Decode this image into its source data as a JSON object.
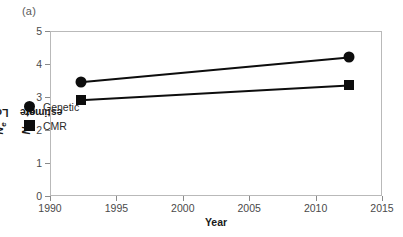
{
  "panel_label": "(a)",
  "chart_data": {
    "type": "line",
    "title": "",
    "subtitle": "",
    "xlabel": "Year",
    "ylabel": "Log Ne or Nb estimate",
    "ylabel_parts": {
      "prefix": "Log ",
      "sym1": "N",
      "sub1": "e",
      "middle": " or ",
      "sym2": "N",
      "sub2": "b",
      "suffix": " estimate"
    },
    "xlim": [
      1990,
      2015
    ],
    "ylim": [
      0,
      5
    ],
    "xticks": [
      1990,
      1995,
      2000,
      2005,
      2010,
      2015
    ],
    "xtick_labels": [
      "1990",
      "1995",
      "2000",
      "2005",
      "2010",
      "2015"
    ],
    "yticks": [
      0,
      1,
      2,
      3,
      4,
      5
    ],
    "ytick_labels": [
      "0",
      "1",
      "2",
      "3",
      "4",
      "5"
    ],
    "grid": false,
    "legend_position": "inside-left",
    "marker_color": "#0d0d0d",
    "line_color": "#0d0d0d",
    "series": [
      {
        "name": "Genetic",
        "marker": "circle",
        "x": [
          1992.3,
          2012.5
        ],
        "values": [
          3.45,
          4.2
        ]
      },
      {
        "name": "CMR",
        "marker": "square",
        "x": [
          1992.3,
          2012.5
        ],
        "values": [
          2.9,
          3.35
        ]
      }
    ]
  },
  "legend": {
    "items": [
      {
        "label": "Genetic",
        "marker": "circle"
      },
      {
        "label": "CMR",
        "marker": "square"
      }
    ]
  }
}
